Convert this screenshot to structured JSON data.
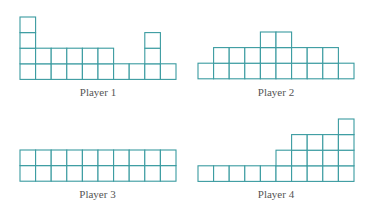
{
  "colors": {
    "line": "#3a9ba0",
    "fill": "#ffffff",
    "label": "#555555"
  },
  "cell_size": 15.6,
  "players": [
    {
      "label": "Player 1",
      "heights": [
        4,
        2,
        2,
        2,
        2,
        2,
        1,
        1,
        3,
        1
      ],
      "x": 20,
      "baseline": 79,
      "label_y": 86
    },
    {
      "label": "Player 2",
      "heights": [
        1,
        2,
        2,
        2,
        3,
        3,
        2,
        2,
        2,
        1
      ],
      "x": 198,
      "baseline": 79,
      "label_y": 86
    },
    {
      "label": "Player 3",
      "heights": [
        2,
        2,
        2,
        2,
        2,
        2,
        2,
        2,
        2,
        2
      ],
      "x": 19.5,
      "baseline": 181,
      "label_y": 188
    },
    {
      "label": "Player 4",
      "heights": [
        1,
        1,
        1,
        1,
        1,
        2,
        3,
        3,
        3,
        4
      ],
      "x": 198,
      "baseline": 181,
      "label_y": 188
    }
  ]
}
